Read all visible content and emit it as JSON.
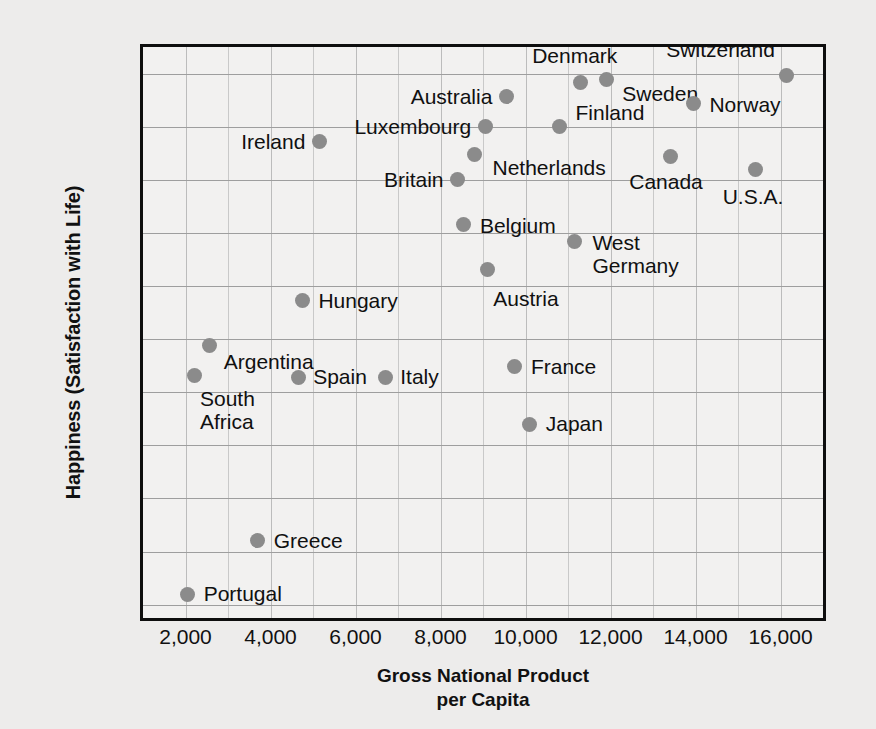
{
  "chart_data": {
    "type": "scatter",
    "title": "",
    "xlabel": "Gross National Product per Capita",
    "xlabel_line1": "Gross National Product",
    "xlabel_line2": "per Capita",
    "ylabel": "Happiness (Satisfaction with Life)",
    "xlim": [
      1000,
      17000
    ],
    "ylim": [
      5.4375,
      8.125
    ],
    "xticks": [
      2000,
      4000,
      6000,
      8000,
      10000,
      12000,
      14000,
      16000
    ],
    "xticklabels": [
      "2,000",
      "4,000",
      "6,000",
      "8,000",
      "10,000",
      "12,000",
      "14,000",
      "16,000"
    ],
    "yticks": [
      5.5,
      5.75,
      6.0,
      6.25,
      6.5,
      6.75,
      7.0,
      7.25,
      7.5,
      7.75,
      8.0
    ],
    "yticklabels": [
      "5.5",
      "5.75",
      "6.0",
      "6.25",
      "6.5",
      "6.75",
      "7.0",
      "7.25",
      "7.5",
      "7.75",
      "8.0"
    ],
    "grid": "horizontal solid, vertical faint every 1,000",
    "legend": "none",
    "marker_color": "#8b8b8b",
    "points": [
      {
        "name": "Portugal",
        "x": 2050,
        "y": 5.55,
        "label": "Portugal",
        "align": "r",
        "dx": 16,
        "dy": 0
      },
      {
        "name": "Greece",
        "x": 3700,
        "y": 5.8,
        "label": "Greece",
        "align": "r",
        "dx": 16,
        "dy": 0
      },
      {
        "name": "South Africa",
        "x": 2200,
        "y": 6.58,
        "label": "South\nAfrica",
        "align": "r",
        "dx": 6,
        "dy": 36
      },
      {
        "name": "Argentina",
        "x": 2570,
        "y": 6.72,
        "label": "Argentina",
        "align": "r",
        "dx": 14,
        "dy": 16
      },
      {
        "name": "Spain",
        "x": 4650,
        "y": 6.57,
        "label": "Spain",
        "align": "r",
        "dx": 15,
        "dy": 0
      },
      {
        "name": "Italy",
        "x": 6700,
        "y": 6.57,
        "label": "Italy",
        "align": "r",
        "dx": 15,
        "dy": 0
      },
      {
        "name": "Hungary",
        "x": 4750,
        "y": 6.93,
        "label": "Hungary",
        "align": "r",
        "dx": 16,
        "dy": 0
      },
      {
        "name": "Japan",
        "x": 10100,
        "y": 6.35,
        "label": "Japan",
        "align": "r",
        "dx": 16,
        "dy": 0
      },
      {
        "name": "France",
        "x": 9750,
        "y": 6.62,
        "label": "France",
        "align": "r",
        "dx": 16,
        "dy": 0
      },
      {
        "name": "Austria",
        "x": 9100,
        "y": 7.08,
        "label": "Austria",
        "align": "r",
        "dx": 6,
        "dy": 30
      },
      {
        "name": "Belgium",
        "x": 8550,
        "y": 7.29,
        "label": "Belgium",
        "align": "r",
        "dx": 16,
        "dy": 2
      },
      {
        "name": "West Germany",
        "x": 11150,
        "y": 7.21,
        "label": "West\nGermany",
        "align": "r",
        "dx": 18,
        "dy": 14
      },
      {
        "name": "Britain",
        "x": 8400,
        "y": 7.5,
        "label": "Britain",
        "align": "l",
        "dx": -14,
        "dy": 0
      },
      {
        "name": "Ireland",
        "x": 5150,
        "y": 7.68,
        "label": "Ireland",
        "align": "l",
        "dx": -14,
        "dy": 0
      },
      {
        "name": "Netherlands",
        "x": 8800,
        "y": 7.62,
        "label": "Netherlands",
        "align": "r",
        "dx": 18,
        "dy": 14
      },
      {
        "name": "Luxembourg",
        "x": 9050,
        "y": 7.75,
        "label": "Luxembourg",
        "align": "l",
        "dx": -14,
        "dy": 0
      },
      {
        "name": "Finland",
        "x": 10800,
        "y": 7.75,
        "label": "Finland",
        "align": "r",
        "dx": 16,
        "dy": -14
      },
      {
        "name": "Australia",
        "x": 9550,
        "y": 7.89,
        "label": "Australia",
        "align": "l",
        "dx": -14,
        "dy": 0
      },
      {
        "name": "Denmark",
        "x": 11300,
        "y": 7.96,
        "label": "Denmark",
        "align": "c",
        "dx": -6,
        "dy": -26
      },
      {
        "name": "Sweden",
        "x": 11900,
        "y": 7.97,
        "label": "Sweden",
        "align": "r",
        "dx": 16,
        "dy": 14
      },
      {
        "name": "Canada",
        "x": 13400,
        "y": 7.61,
        "label": "Canada",
        "align": "c",
        "dx": -4,
        "dy": 26
      },
      {
        "name": "Norway",
        "x": 13950,
        "y": 7.86,
        "label": "Norway",
        "align": "r",
        "dx": 16,
        "dy": 2
      },
      {
        "name": "U.S.A.",
        "x": 15400,
        "y": 7.55,
        "label": "U.S.A.",
        "align": "c",
        "dx": -2,
        "dy": 28
      },
      {
        "name": "Switzerland",
        "x": 16150,
        "y": 7.99,
        "label": "Switzerland",
        "align": "l",
        "dx": -12,
        "dy": -26
      }
    ]
  }
}
